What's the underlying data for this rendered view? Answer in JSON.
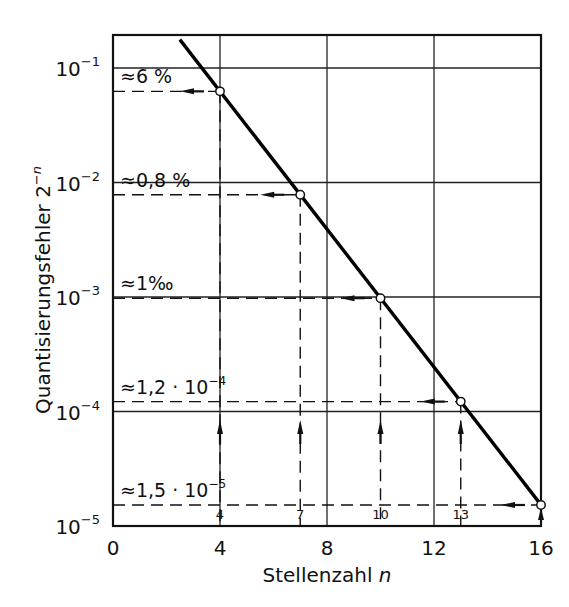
{
  "chart_data": {
    "type": "line",
    "title": "",
    "xlabel": "Stellenzahl n",
    "xlabel_text": "Stellenzahl",
    "xlabel_var": "n",
    "ylabel": "Quantisierungsfehler 2^-n",
    "ylabel_text": "Quantisierungsfehler 2",
    "ylabel_exp": "-n",
    "xlim": [
      0,
      16
    ],
    "ylim": [
      1e-05,
      0.2
    ],
    "yscale": "log",
    "grid": true,
    "x_ticks": [
      0,
      4,
      8,
      12,
      16
    ],
    "y_ticks": [
      {
        "value": 0.1,
        "base": "10",
        "exp": "-1"
      },
      {
        "value": 0.01,
        "base": "10",
        "exp": "-2"
      },
      {
        "value": 0.001,
        "base": "10",
        "exp": "-3"
      },
      {
        "value": 0.0001,
        "base": "10",
        "exp": "-4"
      },
      {
        "value": 1e-05,
        "base": "10",
        "exp": "-5"
      }
    ],
    "series": [
      {
        "name": "2^-n",
        "x": [
          2.5,
          16
        ],
        "y": [
          0.177,
          1.53e-05
        ],
        "style": "solid-thick"
      }
    ],
    "marked_points": [
      {
        "n": 4,
        "value": 0.0625,
        "label": "≈6 %",
        "label_main": "≈6 %",
        "label_exp": ""
      },
      {
        "n": 7,
        "value": 0.0078125,
        "label": "≈0,8 %",
        "label_main": "≈0,8 %",
        "label_exp": ""
      },
      {
        "n": 10,
        "value": 0.0009765625,
        "label": "≈1 ‰",
        "label_main": "≈1‰",
        "label_exp": ""
      },
      {
        "n": 13,
        "value": 0.0001220703,
        "label": "≈1,2 · 10^-4",
        "label_main": "≈1,2 · 10",
        "label_exp": "-4"
      },
      {
        "n": 16,
        "value": 1.52588e-05,
        "label": "≈1,5 · 10^-5",
        "label_main": "≈1,5 · 10",
        "label_exp": "-5"
      }
    ],
    "n_markers": [
      "4",
      "7",
      "10",
      "13"
    ]
  }
}
